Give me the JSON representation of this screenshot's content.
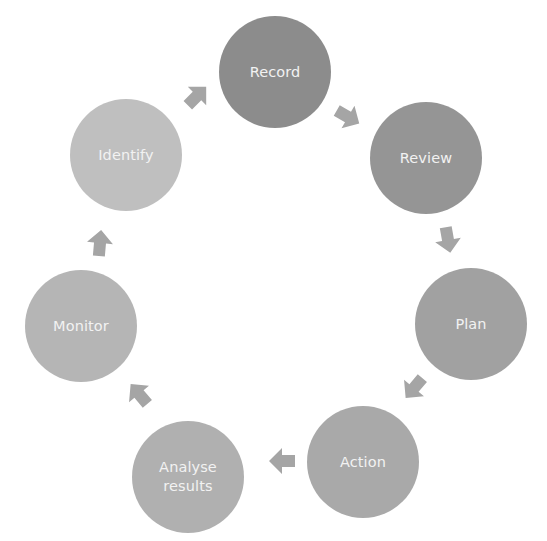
{
  "diagram": {
    "type": "cycle",
    "nodes": [
      {
        "id": "record",
        "label": "Record",
        "color": "#8c8c8c",
        "cx": 275,
        "cy": 72
      },
      {
        "id": "review",
        "label": "Review",
        "color": "#959595",
        "cx": 426,
        "cy": 158
      },
      {
        "id": "plan",
        "label": "Plan",
        "color": "#a1a1a1",
        "cx": 471,
        "cy": 324
      },
      {
        "id": "action",
        "label": "Action",
        "color": "#a9a9a9",
        "cx": 363,
        "cy": 462
      },
      {
        "id": "analyse",
        "label": "Analyse\nresults",
        "color": "#b0b0b0",
        "cx": 188,
        "cy": 477
      },
      {
        "id": "monitor",
        "label": "Monitor",
        "color": "#b5b5b5",
        "cx": 81,
        "cy": 326
      },
      {
        "id": "identify",
        "label": "Identify",
        "color": "#bfbfbf",
        "cx": 126,
        "cy": 155
      }
    ],
    "edges": [
      {
        "from": "identify",
        "to": "record",
        "x": 197,
        "y": 96,
        "angle": -45
      },
      {
        "from": "record",
        "to": "review",
        "x": 348,
        "y": 117,
        "angle": 30
      },
      {
        "from": "review",
        "to": "plan",
        "x": 448,
        "y": 240,
        "angle": 80
      },
      {
        "from": "plan",
        "to": "action",
        "x": 414,
        "y": 388,
        "angle": 130
      },
      {
        "from": "action",
        "to": "analyse",
        "x": 282,
        "y": 461,
        "angle": 180
      },
      {
        "from": "analyse",
        "to": "monitor",
        "x": 139,
        "y": 394,
        "angle": -130
      },
      {
        "from": "monitor",
        "to": "identify",
        "x": 100,
        "y": 243,
        "angle": -85
      }
    ],
    "arrow_color": "#a5a5a5"
  }
}
